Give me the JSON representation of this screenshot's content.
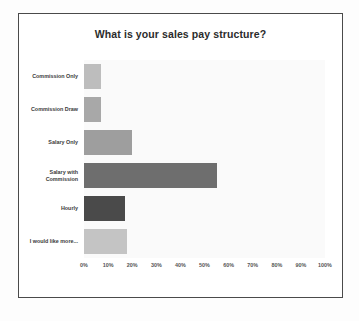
{
  "chart_data": {
    "type": "bar",
    "orientation": "horizontal",
    "title": "What is your sales pay structure?",
    "xlabel": "",
    "ylabel": "",
    "xlim": [
      0,
      100
    ],
    "xtick_labels": [
      "0%",
      "10%",
      "20%",
      "30%",
      "40%",
      "50%",
      "60%",
      "70%",
      "80%",
      "90%",
      "100%"
    ],
    "xticks": [
      0,
      10,
      20,
      30,
      40,
      50,
      60,
      70,
      80,
      90,
      100
    ],
    "grid": false,
    "legend": "none",
    "categories": [
      "Commission Only",
      "Commission Draw",
      "Salary Only",
      "Salary with Commission",
      "Hourly",
      "I would like more..."
    ],
    "values": [
      7,
      7,
      20,
      55,
      17,
      18
    ],
    "bar_colors": [
      "#bdbdbd",
      "#a8a8a8",
      "#9e9e9e",
      "#6e6e6e",
      "#4a4a4a",
      "#c4c4c4"
    ]
  },
  "style": {
    "card_border_color": "#4a4a4a",
    "plot_background": "#fafafa",
    "title_color": "#2b2b2b",
    "label_color": "#3a3a3a",
    "tick_color": "#555555"
  }
}
